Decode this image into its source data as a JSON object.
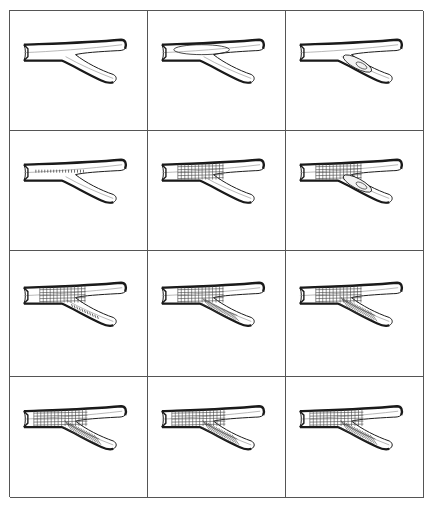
{
  "figure": {
    "layout": {
      "rows": 4,
      "cols": 3
    },
    "colors": {
      "ink": "#1a1a1a",
      "grid_line": "#555555",
      "background": "#ffffff",
      "mesh": "#444444"
    },
    "panels": [
      {
        "index": 1,
        "stage": "empty-vessel",
        "mesh": "none",
        "balloon": "none"
      },
      {
        "index": 2,
        "stage": "balloon-main",
        "mesh": "none",
        "balloon": "main"
      },
      {
        "index": 3,
        "stage": "balloon-side",
        "mesh": "none",
        "balloon": "side"
      },
      {
        "index": 4,
        "stage": "crimped-stent-main",
        "mesh": "crimped",
        "balloon": "none"
      },
      {
        "index": 5,
        "stage": "stent-main-expanded",
        "mesh": "main",
        "balloon": "none"
      },
      {
        "index": 6,
        "stage": "stent-main-side-balloon",
        "mesh": "main",
        "balloon": "side"
      },
      {
        "index": 7,
        "stage": "stent-main-crimped-side",
        "mesh": "main+side-crimped",
        "balloon": "none"
      },
      {
        "index": 8,
        "stage": "stent-main-and-side-diagonal",
        "mesh": "main+side-diagonal",
        "balloon": "none"
      },
      {
        "index": 9,
        "stage": "stent-main-and-side",
        "mesh": "main+side",
        "balloon": "none"
      },
      {
        "index": 10,
        "stage": "final-a",
        "mesh": "full",
        "balloon": "none"
      },
      {
        "index": 11,
        "stage": "final-b",
        "mesh": "full",
        "balloon": "none"
      },
      {
        "index": 12,
        "stage": "final-c",
        "mesh": "full",
        "balloon": "none"
      }
    ]
  }
}
